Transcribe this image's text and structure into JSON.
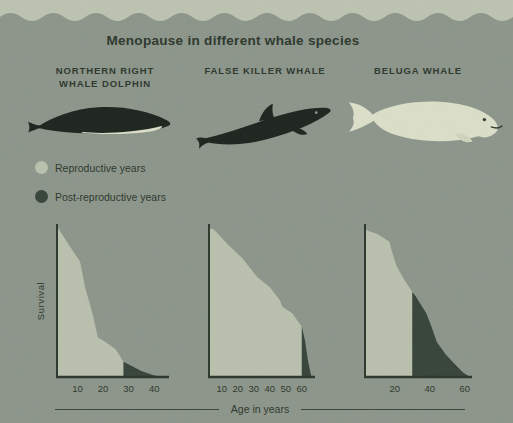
{
  "title": "Menopause in different whale species",
  "species": [
    {
      "label_lines": [
        "NORTHERN RIGHT",
        "WHALE DOLPHIN"
      ]
    },
    {
      "label_lines": [
        "FALSE KILLER WHALE"
      ]
    },
    {
      "label_lines": [
        "BELUGA WHALE"
      ]
    }
  ],
  "legend": {
    "reproductive_label": "Reproductive years",
    "post_reproductive_label": "Post-reproductive years"
  },
  "ylabel": "Survival",
  "xlabel": "Age in years",
  "colors": {
    "background": "#8c958a",
    "top_band": "#bcc3b0",
    "reproductive_fill": "#b9c0ad",
    "post_reproductive_fill": "#37443a",
    "axis_and_text": "#2c372c",
    "whale_black": "#1e241e",
    "beluga_cream": "#dbdfc8"
  },
  "chart_data": [
    {
      "type": "area",
      "species": "Northern right whale dolphin",
      "title": "",
      "xlabel": "Age in years",
      "ylabel": "Survival",
      "x_ticks": [
        10,
        20,
        30,
        40
      ],
      "axis_age_start": 2,
      "axis_age_end": 45,
      "menopause_age": 28,
      "points": [
        [
          2,
          99
        ],
        [
          7,
          86
        ],
        [
          11,
          76
        ],
        [
          13,
          59
        ],
        [
          16,
          41
        ],
        [
          18,
          26
        ],
        [
          21,
          23
        ],
        [
          25,
          18
        ],
        [
          28,
          10
        ],
        [
          35,
          4
        ],
        [
          40,
          1
        ],
        [
          45,
          0
        ]
      ],
      "series_note": "survival % vs age; reproductive until 28, post-reproductive 28-45"
    },
    {
      "type": "area",
      "species": "False killer whale",
      "title": "",
      "xlabel": "Age in years",
      "ylabel": "Survival",
      "x_ticks": [
        10,
        20,
        30,
        40,
        50,
        60
      ],
      "axis_age_start": 2,
      "axis_age_end": 67,
      "menopause_age": 60,
      "points": [
        [
          2,
          98
        ],
        [
          5,
          97
        ],
        [
          14,
          87
        ],
        [
          23,
          78
        ],
        [
          32,
          66
        ],
        [
          40,
          59
        ],
        [
          46,
          51
        ],
        [
          48,
          46
        ],
        [
          54,
          42
        ],
        [
          58,
          36
        ],
        [
          60,
          33
        ],
        [
          62,
          24
        ],
        [
          64,
          10
        ],
        [
          66,
          0
        ]
      ],
      "series_note": "survival % vs age; reproductive until 60, post-reproductive 60-66"
    },
    {
      "type": "area",
      "species": "Beluga whale",
      "title": "",
      "xlabel": "Age in years",
      "ylabel": "Survival",
      "x_ticks": [
        20,
        40,
        60
      ],
      "axis_age_start": 3,
      "axis_age_end": 63,
      "menopause_age": 30,
      "points": [
        [
          3,
          97
        ],
        [
          5,
          96
        ],
        [
          10,
          94
        ],
        [
          17,
          89
        ],
        [
          18,
          84
        ],
        [
          21,
          73
        ],
        [
          26,
          63
        ],
        [
          30,
          56
        ],
        [
          32,
          53
        ],
        [
          38,
          42
        ],
        [
          41,
          33
        ],
        [
          44,
          23
        ],
        [
          49,
          15
        ],
        [
          53,
          10
        ],
        [
          59,
          3
        ],
        [
          63,
          0
        ]
      ],
      "series_note": "survival % vs age; reproductive until 30, post-reproductive 30-63"
    }
  ]
}
